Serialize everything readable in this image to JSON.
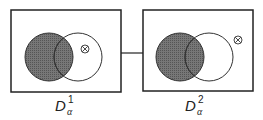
{
  "panels": [
    {
      "label": "D",
      "subscript": "α",
      "superscript": "1",
      "marker": "⊗"
    },
    {
      "label": "D",
      "subscript": "α",
      "superscript": "2",
      "marker": "⊗"
    }
  ],
  "colors": {
    "stroke": "#222222",
    "shade": "#6e6e6e",
    "background": "#ffffff"
  }
}
